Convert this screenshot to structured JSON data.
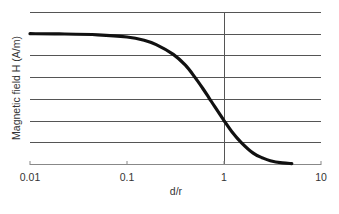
{
  "chart_data": {
    "type": "line",
    "title": "",
    "xlabel": "d/r",
    "ylabel": "Magnetic field H (A/m)",
    "xscale": "log",
    "xlim": [
      0.01,
      10
    ],
    "ylim": [
      0,
      7
    ],
    "x_ticks": [
      "0.01",
      "0.1",
      "1",
      "10"
    ],
    "y_ticks": [],
    "grid": {
      "horizontal": true,
      "vertical_at": [
        1
      ]
    },
    "legend": null,
    "series": [
      {
        "name": "H",
        "x": [
          0.01,
          0.02,
          0.05,
          0.1,
          0.15,
          0.2,
          0.3,
          0.4,
          0.5,
          0.6,
          0.7,
          0.8,
          1.0,
          1.2,
          1.5,
          2.0,
          2.5,
          3.0,
          4.0,
          5.0
        ],
        "values": [
          6.0,
          5.99,
          5.95,
          5.85,
          5.7,
          5.5,
          5.05,
          4.55,
          4.0,
          3.5,
          3.05,
          2.65,
          2.0,
          1.5,
          1.0,
          0.5,
          0.28,
          0.15,
          0.05,
          0.02
        ]
      }
    ]
  }
}
